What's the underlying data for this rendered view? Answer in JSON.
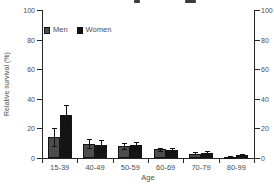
{
  "chart_data": {
    "type": "bar",
    "title": "",
    "xlabel": "Age",
    "ylabel": "Relative survival (%)",
    "ylim": [
      0,
      100
    ],
    "yticks": [
      0,
      20,
      40,
      60,
      80,
      100
    ],
    "ytick_labels": [
      "0",
      "20",
      "40",
      "60",
      "80",
      "100"
    ],
    "right_axis_mirrored": true,
    "grid": false,
    "legend_position": "top-left-inside",
    "categories": [
      "15-39",
      "40-49",
      "50-59",
      "60-69",
      "70-79",
      "80-99"
    ],
    "series": [
      {
        "name": "Men",
        "color": "#4d4d4d",
        "values": [
          14,
          9.5,
          8,
          6,
          3,
          1
        ],
        "error_low": [
          8,
          7,
          6,
          5,
          2.5,
          0.5
        ],
        "error_high": [
          20,
          13,
          10,
          7,
          4,
          1.5
        ]
      },
      {
        "name": "Women",
        "color": "#141414",
        "values": [
          29,
          8.5,
          8.5,
          5.5,
          3.5,
          2
        ],
        "error_low": [
          22,
          5.5,
          6.5,
          4.5,
          3,
          1.5
        ],
        "error_high": [
          36,
          12,
          11,
          6.5,
          4.5,
          2.5
        ]
      }
    ],
    "colors": {
      "axis": "#262626",
      "text": "#4d4d4d",
      "men_bar": "#4d4d4d",
      "women_bar": "#141414"
    }
  }
}
